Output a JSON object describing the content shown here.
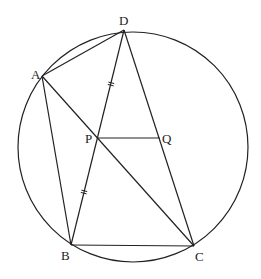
{
  "diagram": {
    "circle": {
      "cx": 133,
      "cy": 147,
      "r": 115
    },
    "points": {
      "A": {
        "x": 42,
        "y": 76,
        "label": "A",
        "lx": 31,
        "ly": 79
      },
      "B": {
        "x": 71,
        "y": 245,
        "label": "B",
        "lx": 61,
        "ly": 260
      },
      "C": {
        "x": 194,
        "y": 246,
        "label": "C",
        "lx": 195,
        "ly": 261
      },
      "D": {
        "x": 124,
        "y": 30,
        "label": "D",
        "lx": 119,
        "ly": 25
      },
      "P": {
        "x": 97,
        "y": 138,
        "label": "P",
        "lx": 85,
        "ly": 143
      },
      "Q": {
        "x": 160,
        "y": 138,
        "label": "Q",
        "lx": 162,
        "ly": 143
      }
    },
    "segments": [
      [
        "A",
        "D"
      ],
      [
        "A",
        "B"
      ],
      [
        "A",
        "C"
      ],
      [
        "D",
        "B"
      ],
      [
        "D",
        "C"
      ],
      [
        "B",
        "C"
      ],
      [
        "P",
        "Q"
      ]
    ],
    "tick_marks": [
      {
        "x": 111,
        "y": 84,
        "note": "equal-length mark on DP"
      },
      {
        "x": 84,
        "y": 192,
        "note": "equal-length mark on PB"
      }
    ],
    "stroke_color": "#222222"
  }
}
